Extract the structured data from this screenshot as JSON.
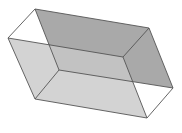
{
  "figure": {
    "colors": {
      "background": "#ffffff",
      "edge": "#555555",
      "dark_plane": "#9a9a9a",
      "light_plane": "#c4c4c4"
    },
    "vertices": {
      "A_top_back_left": [
        35,
        9
      ],
      "B_top_back_right": [
        149,
        28
      ],
      "C_left_front_top": [
        8,
        38
      ],
      "D_inner_front_top": [
        123,
        57
      ],
      "E_right": [
        173,
        88
      ],
      "F_hidden_back_bottom": [
        59,
        70
      ],
      "G_bottom_front_left": [
        35,
        99
      ],
      "H_bottom_front_right": [
        147,
        118
      ],
      "I_back_right_bottom": [
        133,
        83
      ]
    }
  }
}
